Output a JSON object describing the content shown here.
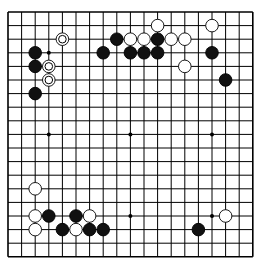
{
  "board": {
    "size": 19,
    "origin_x": 8,
    "origin_y": 12,
    "spacing": 13.6,
    "line_color": "#000000",
    "background": "#ffffff",
    "star_points": [
      [
        3,
        3
      ],
      [
        9,
        3
      ],
      [
        15,
        3
      ],
      [
        3,
        9
      ],
      [
        9,
        9
      ],
      [
        15,
        9
      ],
      [
        3,
        15
      ],
      [
        9,
        15
      ],
      [
        15,
        15
      ]
    ],
    "stones": [
      {
        "c": 4,
        "r": 2,
        "color": "white",
        "marked": true
      },
      {
        "c": 2,
        "r": 3,
        "color": "black"
      },
      {
        "c": 2,
        "r": 4,
        "color": "black"
      },
      {
        "c": 3,
        "r": 4,
        "color": "white",
        "marked": true
      },
      {
        "c": 3,
        "r": 5,
        "color": "white",
        "marked": true
      },
      {
        "c": 2,
        "r": 6,
        "color": "black"
      },
      {
        "c": 7,
        "r": 3,
        "color": "black"
      },
      {
        "c": 8,
        "r": 2,
        "color": "black"
      },
      {
        "c": 9,
        "r": 2,
        "color": "white"
      },
      {
        "c": 10,
        "r": 2,
        "color": "white"
      },
      {
        "c": 11,
        "r": 2,
        "color": "black"
      },
      {
        "c": 12,
        "r": 2,
        "color": "white"
      },
      {
        "c": 13,
        "r": 2,
        "color": "white"
      },
      {
        "c": 11,
        "r": 1,
        "color": "white"
      },
      {
        "c": 9,
        "r": 3,
        "color": "black"
      },
      {
        "c": 10,
        "r": 3,
        "color": "black"
      },
      {
        "c": 11,
        "r": 3,
        "color": "black"
      },
      {
        "c": 13,
        "r": 4,
        "color": "white"
      },
      {
        "c": 15,
        "r": 1,
        "color": "white"
      },
      {
        "c": 15,
        "r": 3,
        "color": "black"
      },
      {
        "c": 16,
        "r": 5,
        "color": "black"
      },
      {
        "c": 2,
        "r": 13,
        "color": "white"
      },
      {
        "c": 2,
        "r": 15,
        "color": "white"
      },
      {
        "c": 3,
        "r": 15,
        "color": "black"
      },
      {
        "c": 5,
        "r": 15,
        "color": "black"
      },
      {
        "c": 6,
        "r": 15,
        "color": "white"
      },
      {
        "c": 2,
        "r": 16,
        "color": "white"
      },
      {
        "c": 4,
        "r": 16,
        "color": "black"
      },
      {
        "c": 5,
        "r": 16,
        "color": "white"
      },
      {
        "c": 6,
        "r": 16,
        "color": "black"
      },
      {
        "c": 7,
        "r": 16,
        "color": "black"
      },
      {
        "c": 16,
        "r": 15,
        "color": "white"
      },
      {
        "c": 14,
        "r": 16,
        "color": "black"
      }
    ]
  }
}
